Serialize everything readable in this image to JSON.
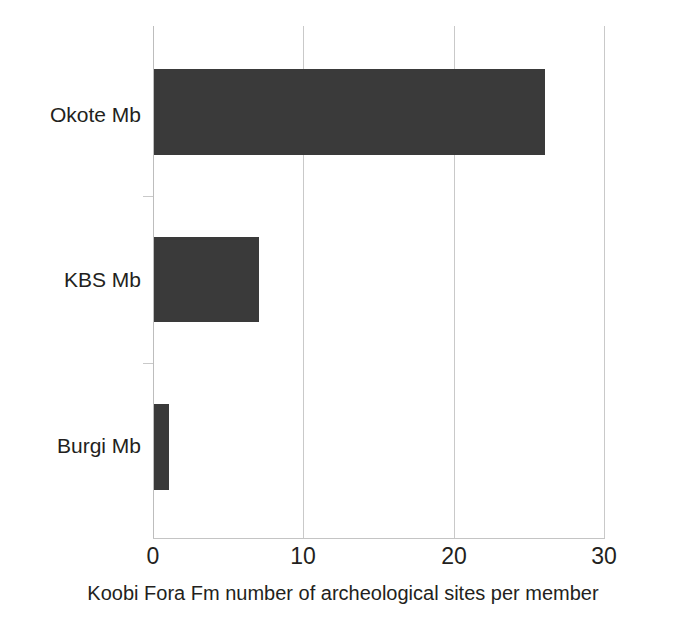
{
  "chart_data": {
    "type": "bar",
    "orientation": "horizontal",
    "title": "",
    "subtitle": "",
    "xlabel": "Koobi Fora Fm number of archeological sites per member",
    "ylabel": "",
    "categories": [
      "Burgi Mb",
      "KBS Mb",
      "Okote Mb"
    ],
    "values": [
      1,
      7,
      26
    ],
    "series": [
      {
        "name": "number of archeological sites",
        "values": [
          1,
          7,
          26
        ]
      }
    ],
    "xlim": [
      0,
      30
    ],
    "xticks": [
      0,
      10,
      20,
      30
    ],
    "xtick_labels": [
      "0",
      "10",
      "20",
      "30"
    ],
    "grid": "vertical",
    "legend": "none",
    "bar_color": "#3a3a3a",
    "gridline_color": "#c9c9c9",
    "axis_color": "#c4c4c4",
    "background_color": "#ffffff",
    "annotations": []
  },
  "caption": {
    "text": "Koobi Fora Fm number of archeological sites per member"
  },
  "axis": {
    "x_tick_0": "0",
    "x_tick_1": "10",
    "x_tick_2": "20",
    "x_tick_3": "30"
  },
  "categories": {
    "okote": "Okote Mb",
    "kbs": "KBS Mb",
    "burgi": "Burgi Mb"
  }
}
